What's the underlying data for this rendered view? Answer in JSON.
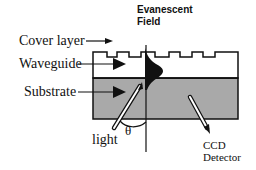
{
  "figure": {
    "labels": {
      "cover_layer": "Cover layer",
      "waveguide": "Waveguide",
      "substrate": "Substrate",
      "evanescent_line1": "Evanescent",
      "evanescent_line2": "Field",
      "light": "light",
      "theta": "θ",
      "ccd_line1": "CCD",
      "ccd_line2": "Detector"
    },
    "colors": {
      "substrate_fill": "#a9a9a9",
      "cover_fill": "#ffffff",
      "stroke": "#111111",
      "background": "#ffffff"
    },
    "components": [
      {
        "name": "cover layer",
        "description": "top grating surface with rectangular teeth"
      },
      {
        "name": "waveguide",
        "description": "white layer with guided light arrow"
      },
      {
        "name": "substrate",
        "description": "gray layer"
      },
      {
        "name": "evanescent field",
        "description": "black lobe profile at normal line"
      },
      {
        "name": "light",
        "description": "incident light rod at angle theta to normal"
      },
      {
        "name": "CCD detector",
        "description": "outgoing rod to detector"
      }
    ]
  }
}
